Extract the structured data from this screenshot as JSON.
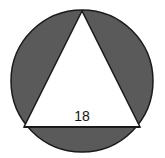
{
  "diagram": {
    "circle": {
      "cx": 82,
      "cy": 81,
      "r": 71,
      "fill": "#5a5a5a",
      "stroke": "#1a1a1a"
    },
    "triangle": {
      "points": "82,11 24,127 140,127",
      "fill": "#ffffff",
      "stroke": "#1a1a1a"
    },
    "labels": {
      "side_length": "18"
    },
    "colors": {
      "shaded_region": "#5a5a5a",
      "background": "#ffffff",
      "outline": "#1a1a1a"
    }
  }
}
